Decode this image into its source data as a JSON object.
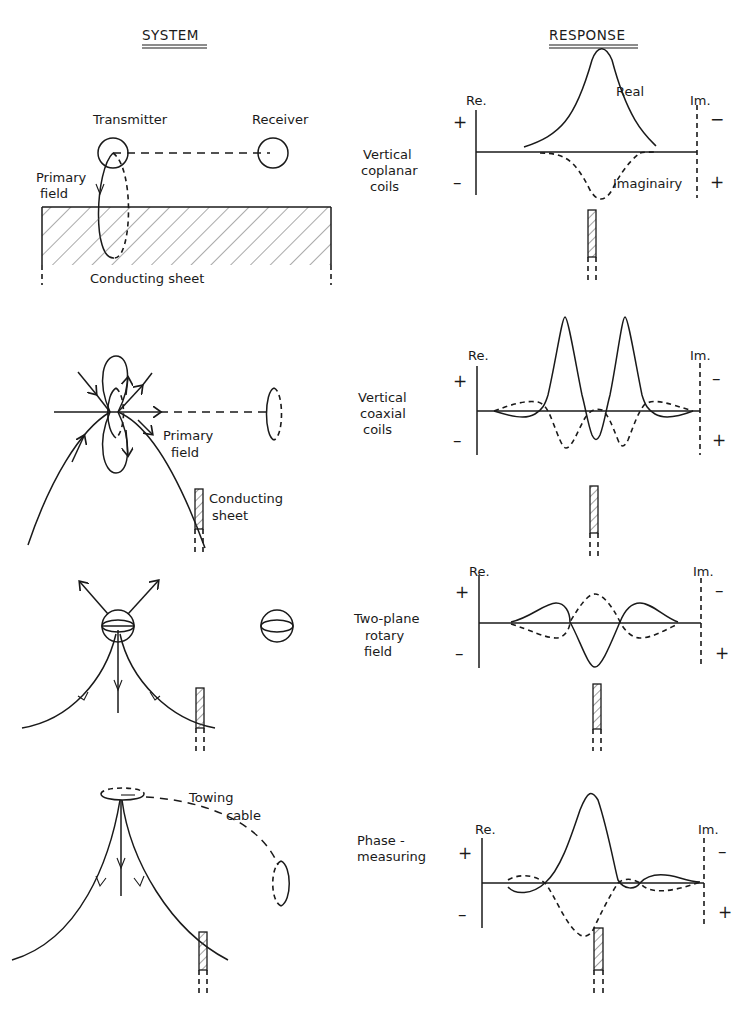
{
  "headers": {
    "system": "SYSTEM",
    "response": "RESPONSE"
  },
  "axis": {
    "re_label": "Re.",
    "im_label": "Im.",
    "plus": "+",
    "minus": "−",
    "dash": "–"
  },
  "rows": [
    {
      "name": "Vertical coplanar coils",
      "label_lines": [
        "Vertical",
        "coplanar",
        "coils"
      ],
      "system_labels": {
        "transmitter": "Transmitter",
        "receiver": "Receiver",
        "primary_field_1": "Primary",
        "primary_field_2": "field",
        "conducting_sheet": "Conducting sheet"
      },
      "curve_labels": {
        "real": "Real",
        "imaginary": "Imaginairy"
      }
    },
    {
      "name": "Vertical coaxial coils",
      "label_lines": [
        "Vertical",
        "coaxial",
        "coils"
      ],
      "system_labels": {
        "primary_field_1": "Primary",
        "primary_field_2": "field",
        "conducting_sheet_1": "Conducting",
        "conducting_sheet_2": "sheet"
      }
    },
    {
      "name": "Two-plane rotary field",
      "label_lines": [
        "Two-plane",
        "rotary",
        "field"
      ]
    },
    {
      "name": "Phase-measuring",
      "label_lines": [
        "Phase -",
        "measuring"
      ],
      "system_labels": {
        "towing_cable_1": "Towing",
        "towing_cable_2": "cable"
      }
    }
  ],
  "legend": {
    "solid": "Real component",
    "dashed": "Imaginary component"
  }
}
